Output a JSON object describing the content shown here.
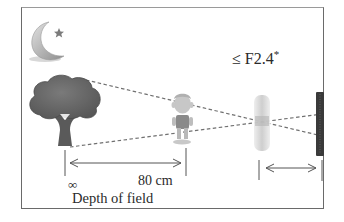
{
  "diagram": {
    "aperture_label": "≤ F2.4",
    "aperture_footnote_mark": "*",
    "near_limit_label": "∞",
    "distance_label": "80 cm",
    "range_caption": "Depth of field",
    "elements": [
      {
        "name": "night-scene-icon",
        "depicts": "crescent moon with star"
      },
      {
        "name": "tree-icon",
        "depicts": "tree at infinity"
      },
      {
        "name": "child-figure",
        "depicts": "child subject at 80 cm"
      },
      {
        "name": "lens",
        "depicts": "camera lens"
      },
      {
        "name": "image-sensor",
        "depicts": "camera sensor"
      }
    ],
    "colors": {
      "frame": "#6a6a6a",
      "text": "#2a2a2a",
      "tree": "#5f5f5f",
      "dash_lines": "#6e6e6e",
      "sensor": "#3a3a3a",
      "lens": "#cfcfcf"
    }
  }
}
